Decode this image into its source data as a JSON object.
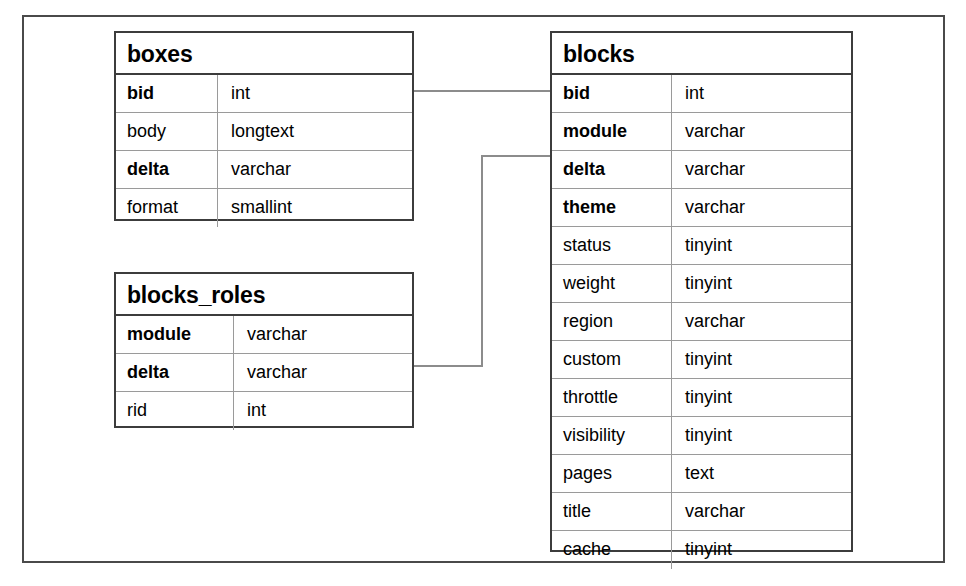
{
  "diagram": {
    "kind": "entity-relationship-diagram",
    "background_color": "#ffffff",
    "frame_color": "#4a4a4a",
    "table_border_color": "#3c3c3c",
    "row_divider_color": "#9a9a9a",
    "connector_color": "#8c8c8c",
    "text_color": "#000000",
    "tables": [
      {
        "id": "boxes",
        "name": "boxes",
        "columns": [
          "field",
          "type"
        ],
        "fields": [
          {
            "name": "bid",
            "type": "int",
            "key": true
          },
          {
            "name": "body",
            "type": "longtext",
            "key": false
          },
          {
            "name": "delta",
            "type": "varchar",
            "key": true
          },
          {
            "name": "format",
            "type": "smallint",
            "key": false
          }
        ]
      },
      {
        "id": "blocks_roles",
        "name": "blocks_roles",
        "columns": [
          "field",
          "type"
        ],
        "fields": [
          {
            "name": "module",
            "type": "varchar",
            "key": true
          },
          {
            "name": "delta",
            "type": "varchar",
            "key": true
          },
          {
            "name": "rid",
            "type": "int",
            "key": false
          }
        ]
      },
      {
        "id": "blocks",
        "name": "blocks",
        "columns": [
          "field",
          "type"
        ],
        "fields": [
          {
            "name": "bid",
            "type": "int",
            "key": true
          },
          {
            "name": "module",
            "type": "varchar",
            "key": true
          },
          {
            "name": "delta",
            "type": "varchar",
            "key": true
          },
          {
            "name": "theme",
            "type": "varchar",
            "key": true
          },
          {
            "name": "status",
            "type": "tinyint",
            "key": false
          },
          {
            "name": "weight",
            "type": "tinyint",
            "key": false
          },
          {
            "name": "region",
            "type": "varchar",
            "key": false
          },
          {
            "name": "custom",
            "type": "tinyint",
            "key": false
          },
          {
            "name": "throttle",
            "type": "tinyint",
            "key": false
          },
          {
            "name": "visibility",
            "type": "tinyint",
            "key": false
          },
          {
            "name": "pages",
            "type": "text",
            "key": false
          },
          {
            "name": "title",
            "type": "varchar",
            "key": false
          },
          {
            "name": "cache",
            "type": "tinyint",
            "key": false
          }
        ]
      }
    ],
    "relationships": [
      {
        "id": "boxes-bid-to-blocks-bid",
        "from_table": "boxes",
        "from_field": "bid",
        "to_table": "blocks",
        "to_field": "bid",
        "path": "M 414 91 L 551 91"
      },
      {
        "id": "blocks-roles-delta-to-blocks-delta",
        "from_table": "blocks_roles",
        "from_field": "delta",
        "to_table": "blocks",
        "to_field": "delta",
        "path": "M 414 366 L 482 366 L 482 156 L 551 156"
      }
    ]
  }
}
